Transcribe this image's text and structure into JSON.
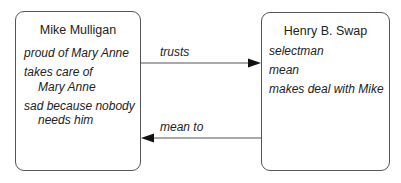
{
  "diagram": {
    "nodes": [
      {
        "id": "mike",
        "title": "Mike Mulligan",
        "attributes": [
          {
            "line1": "proud of Mary Anne"
          },
          {
            "line1": "takes care of",
            "line2": "Mary Anne"
          },
          {
            "line1": "sad because nobody",
            "line2": "needs him"
          }
        ]
      },
      {
        "id": "henry",
        "title": "Henry B. Swap",
        "attributes": [
          {
            "line1": "selectman"
          },
          {
            "line1": "mean"
          },
          {
            "line1": "makes deal with Mike"
          }
        ]
      }
    ],
    "edges": [
      {
        "from": "Mike Mulligan",
        "to": "Henry B. Swap",
        "label": "trusts"
      },
      {
        "from": "Henry B. Swap",
        "to": "Mike Mulligan",
        "label": "mean to"
      }
    ],
    "colors": {
      "stroke": "#555555",
      "text": "#222222",
      "background": "#ffffff"
    }
  }
}
